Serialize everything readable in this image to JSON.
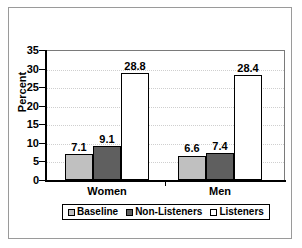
{
  "chart_data": {
    "type": "bar",
    "title": "",
    "xlabel": "",
    "ylabel": "Percent",
    "categories": [
      "Women",
      "Men"
    ],
    "series": [
      {
        "name": "Baseline",
        "values": [
          7.1,
          6.6
        ],
        "color": "#c0c0c0"
      },
      {
        "name": "Non-Listeners",
        "values": [
          9.1,
          7.4
        ],
        "color": "#5f5f5f"
      },
      {
        "name": "Listeners",
        "values": [
          28.8,
          28.4
        ],
        "color": "#ffffff"
      }
    ],
    "ylim": [
      0,
      35
    ],
    "yticks": [
      0,
      5,
      10,
      15,
      20,
      25,
      30,
      35
    ],
    "ytick_labels": [
      "0",
      "5",
      "10",
      "15",
      "20",
      "25",
      "30",
      "35"
    ],
    "grid": true,
    "grid_axis": "y",
    "legend_position": "bottom",
    "data_labels": [
      "7.1",
      "9.1",
      "28.8",
      "6.6",
      "7.4",
      "28.4"
    ]
  },
  "legend": {
    "items": [
      {
        "label": "Baseline",
        "color": "#c0c0c0"
      },
      {
        "label": "Non-Listeners",
        "color": "#5f5f5f"
      },
      {
        "label": "Listeners",
        "color": "#ffffff"
      }
    ]
  }
}
